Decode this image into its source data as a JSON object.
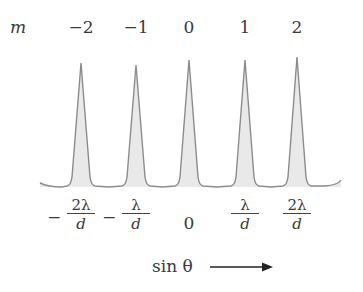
{
  "chart_data": {
    "type": "line",
    "order_label": "m",
    "orders": [
      "−2",
      "−1",
      "0",
      "1",
      "2"
    ],
    "positions": [
      {
        "sign": "−",
        "num": "2λ",
        "den": "d"
      },
      {
        "sign": "−",
        "num": "λ",
        "den": "d"
      },
      {
        "sign": "",
        "num": "0",
        "den": ""
      },
      {
        "sign": "",
        "num": "λ",
        "den": "d"
      },
      {
        "sign": "",
        "num": "2λ",
        "den": "d"
      }
    ],
    "xlabel": "sin θ",
    "peak_x_px": [
      81,
      136,
      189,
      245,
      297
    ],
    "peak_top_y_px": [
      63,
      65,
      60,
      60,
      57
    ],
    "baseline_y_px": 187,
    "colors": {
      "line": "#8a8a8a",
      "fill": "#e8e8e8",
      "text": "#3a3a3a"
    }
  }
}
